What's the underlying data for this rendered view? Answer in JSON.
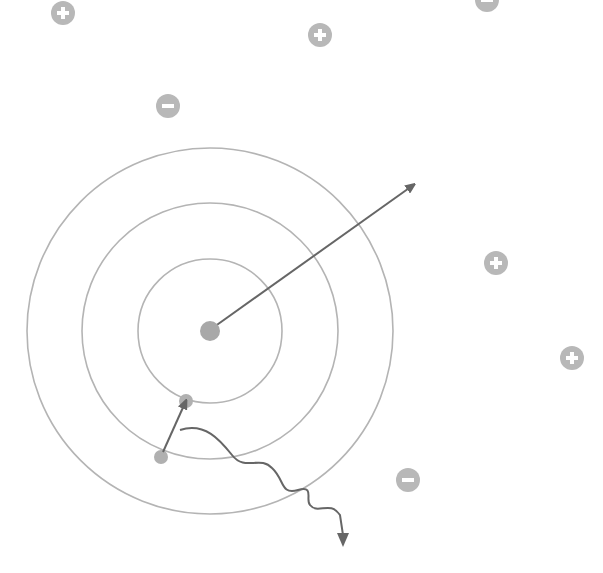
{
  "diagram": {
    "colors": {
      "background": "#ffffff",
      "orbit": "#b4b4b4",
      "arrow": "#666666",
      "nucleus": "#a8a8a8",
      "electron": "#b0b0b0",
      "charge": "#b8b8b8",
      "charge_symbol": "#ffffff"
    },
    "nucleus": {
      "x": 210,
      "y": 331,
      "r": 10
    },
    "orbits": [
      {
        "r": 72
      },
      {
        "r": 128
      },
      {
        "r": 183
      }
    ],
    "radial_arrow": {
      "x1": 214,
      "y1": 327,
      "x2": 412,
      "y2": 186
    },
    "electrons": [
      {
        "x": 186,
        "y": 401,
        "r": 7,
        "label": "final-position"
      },
      {
        "x": 161,
        "y": 457,
        "r": 7,
        "label": "initial-position"
      }
    ],
    "transition_arrow": {
      "x1": 163,
      "y1": 452,
      "x2": 185,
      "y2": 403
    },
    "photon_wave": {
      "path": "M180,430 C205,422 220,440 232,455 C245,472 260,455 272,468 C285,480 280,495 298,490 C315,485 305,500 310,505 C318,515 330,500 340,515 L343,535",
      "arrow_tip": {
        "x": 343,
        "y": 547
      }
    },
    "charges": [
      {
        "sign": "+",
        "x": 63,
        "y": 13
      },
      {
        "sign": "+",
        "x": 320,
        "y": 35
      },
      {
        "sign": "-",
        "x": 487,
        "y": 0
      },
      {
        "sign": "-",
        "x": 168,
        "y": 106
      },
      {
        "sign": "+",
        "x": 496,
        "y": 263
      },
      {
        "sign": "+",
        "x": 572,
        "y": 358
      },
      {
        "sign": "-",
        "x": 408,
        "y": 480
      }
    ],
    "charge_radius": 12
  }
}
